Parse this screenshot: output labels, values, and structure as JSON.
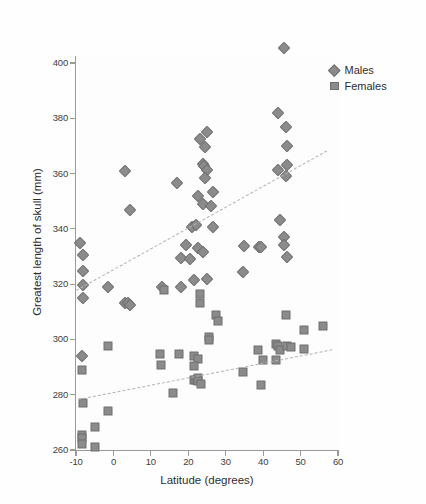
{
  "chart_data": {
    "type": "scatter",
    "title": "",
    "xlabel": "Latitude (degrees)",
    "ylabel": "Greatest length of skull (mm)",
    "xlim": [
      -10,
      60
    ],
    "ylim": [
      260,
      405
    ],
    "xticks": [
      -10,
      0,
      10,
      20,
      30,
      40,
      50,
      60
    ],
    "yticks": [
      260,
      280,
      300,
      320,
      340,
      360,
      380,
      400
    ],
    "grid": false,
    "legend_position": "top-right",
    "marker_color": "#8b8b8b",
    "trendline_color": "#b3b3b3",
    "series": [
      {
        "name": "Males",
        "marker": "diamond",
        "points": [
          [
            45.5,
            405.5
          ],
          [
            44.0,
            382.0
          ],
          [
            46.0,
            377.0
          ],
          [
            25.0,
            375.0
          ],
          [
            23.0,
            372.5
          ],
          [
            24.5,
            369.5
          ],
          [
            46.5,
            370.0
          ],
          [
            3.0,
            360.8
          ],
          [
            24.0,
            363.5
          ],
          [
            24.2,
            362.8
          ],
          [
            25.0,
            361.2
          ],
          [
            44.0,
            361.3
          ],
          [
            46.0,
            359.0
          ],
          [
            46.3,
            363.0
          ],
          [
            24.5,
            358.3
          ],
          [
            17.0,
            356.5
          ],
          [
            26.5,
            353.5
          ],
          [
            22.5,
            352.0
          ],
          [
            4.5,
            346.8
          ],
          [
            24.0,
            349.0
          ],
          [
            26.0,
            348.3
          ],
          [
            44.5,
            343.3
          ],
          [
            21.0,
            340.5
          ],
          [
            22.0,
            341.3
          ],
          [
            26.5,
            340.5
          ],
          [
            45.5,
            337.0
          ],
          [
            -9.0,
            334.8
          ],
          [
            19.5,
            334.0
          ],
          [
            45.5,
            334.0
          ],
          [
            35.0,
            333.8
          ],
          [
            -8.0,
            330.5
          ],
          [
            22.5,
            333.0
          ],
          [
            24.0,
            331.5
          ],
          [
            39.0,
            333.5
          ],
          [
            39.5,
            333.5
          ],
          [
            46.5,
            330.0
          ],
          [
            -8.0,
            324.8
          ],
          [
            18.0,
            329.5
          ],
          [
            20.5,
            329.2
          ],
          [
            -8.0,
            319.8
          ],
          [
            -1.5,
            318.8
          ],
          [
            13.0,
            318.8
          ],
          [
            18.0,
            318.8
          ],
          [
            21.5,
            321.5
          ],
          [
            25.0,
            322.0
          ],
          [
            -8.0,
            315.0
          ],
          [
            3.0,
            313.3
          ],
          [
            3.8,
            313.3
          ],
          [
            4.5,
            312.3
          ],
          [
            34.5,
            324.5
          ],
          [
            -8.5,
            294.0
          ]
        ]
      },
      {
        "name": "Females",
        "marker": "square",
        "points": [
          [
            13.5,
            317.8
          ],
          [
            23.0,
            316.5
          ],
          [
            23.0,
            313.3
          ],
          [
            27.5,
            309.0
          ],
          [
            28.0,
            306.8
          ],
          [
            46.0,
            309.0
          ],
          [
            51.0,
            303.5
          ],
          [
            56.0,
            305.0
          ],
          [
            25.5,
            300.8
          ],
          [
            25.5,
            299.8
          ],
          [
            -1.5,
            297.8
          ],
          [
            12.5,
            294.8
          ],
          [
            17.5,
            294.8
          ],
          [
            21.5,
            294.0
          ],
          [
            22.5,
            292.8
          ],
          [
            38.5,
            296.0
          ],
          [
            43.5,
            298.3
          ],
          [
            44.0,
            297.5
          ],
          [
            44.5,
            296.0
          ],
          [
            46.5,
            297.5
          ],
          [
            47.5,
            297.3
          ],
          [
            51.0,
            296.5
          ],
          [
            12.8,
            290.8
          ],
          [
            21.5,
            290.5
          ],
          [
            40.0,
            292.5
          ],
          [
            43.5,
            292.5
          ],
          [
            -8.5,
            288.8
          ],
          [
            34.5,
            288.3
          ],
          [
            21.5,
            285.5
          ],
          [
            22.0,
            285.5
          ],
          [
            22.5,
            286.0
          ],
          [
            22.5,
            285.0
          ],
          [
            23.5,
            283.8
          ],
          [
            39.5,
            283.5
          ],
          [
            16.0,
            280.8
          ],
          [
            -8.0,
            277.0
          ],
          [
            -1.5,
            274.0
          ],
          [
            -5.0,
            268.3
          ],
          [
            -8.5,
            265.3
          ],
          [
            -8.5,
            264.5
          ],
          [
            -8.5,
            262.3
          ],
          [
            -5.0,
            261.0
          ]
        ]
      }
    ],
    "trendlines": [
      {
        "series": "Males",
        "x0": -10,
        "y0": 318.0,
        "x1": 57.0,
        "y1": 368.5
      },
      {
        "series": "Females",
        "x0": -9.5,
        "y0": 278.5,
        "x1": 58.5,
        "y1": 296.5
      }
    ]
  },
  "legend": {
    "items": [
      {
        "label": "Males",
        "marker": "diamond-icon"
      },
      {
        "label": "Females",
        "marker": "square-icon"
      }
    ]
  }
}
